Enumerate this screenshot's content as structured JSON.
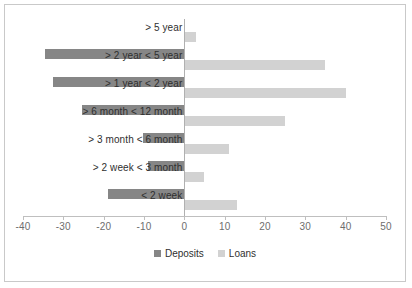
{
  "chart_data": {
    "type": "bar",
    "orientation": "horizontal",
    "title": "",
    "subtitle": "",
    "xlabel": "",
    "ylabel": "",
    "xlim": [
      -40,
      50
    ],
    "xticks": [
      -40,
      -30,
      -20,
      -10,
      0,
      10,
      20,
      30,
      40,
      50
    ],
    "xtick_labels": [
      "-40",
      "-30",
      "-20",
      "-10",
      "0",
      "10",
      "20",
      "30",
      "40",
      "50"
    ],
    "grid": false,
    "legend_position": "bottom",
    "categories": [
      "> 5 year",
      "> 2 year < 5 year",
      "> 1 year < 2 year",
      "> 6 month < 12 month",
      "> 3 month < 6 month",
      "> 2 week < 3 month",
      "< 2 week"
    ],
    "series": [
      {
        "name": "Deposits",
        "color": "#868686",
        "values": [
          0,
          -34.5,
          -32.5,
          -25.3,
          -10.2,
          -9.1,
          -19.0
        ]
      },
      {
        "name": "Loans",
        "color": "#d2d2d2",
        "values": [
          3.0,
          35.0,
          40.0,
          25.0,
          11.0,
          5.0,
          13.0
        ]
      }
    ]
  },
  "legend": {
    "items": [
      {
        "label": "Deposits",
        "color": "#868686"
      },
      {
        "label": "Loans",
        "color": "#d2d2d2"
      }
    ]
  }
}
